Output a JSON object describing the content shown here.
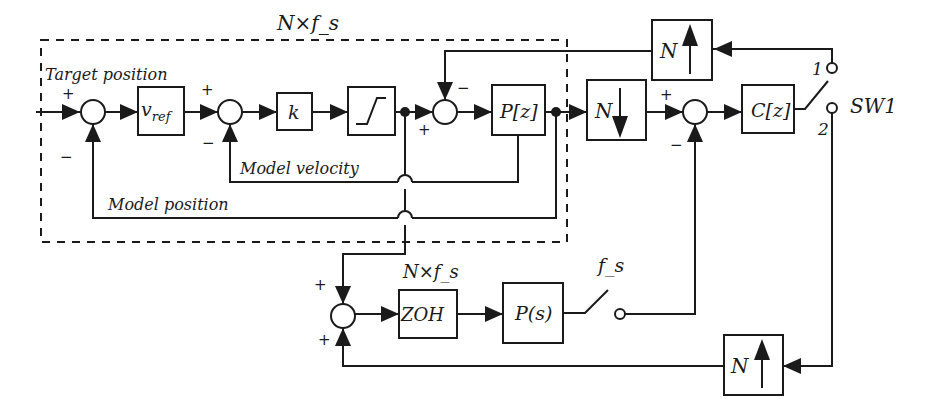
{
  "diagram": {
    "type": "block-diagram",
    "outer_region_label": "N×f_s",
    "lower_region_label": "N×f_s",
    "sampler_label": "f_s",
    "signals": {
      "target_position": "Target position",
      "model_velocity": "Model velocity",
      "model_position": "Model position"
    },
    "blocks": {
      "vref": {
        "main": "v",
        "sub": "ref"
      },
      "k": "k",
      "saturation": "saturation",
      "pz": "P[z]",
      "downsample": "N",
      "cz": "C[z]",
      "upsample_top": "N",
      "zoh": "ZOH",
      "ps": "P(s)",
      "upsample_bottom": "N"
    },
    "switch": {
      "name": "SW1",
      "pos1": "1",
      "pos2": "2"
    },
    "signs": {
      "sum1_in": "+",
      "sum1_fb": "−",
      "sum2_in": "+",
      "sum2_fb": "−",
      "sum3_in": "+",
      "sum3_fb": "−",
      "sum4_in": "+",
      "sum4_fb": "−",
      "sum5_top": "+",
      "sum5_bottom": "+"
    }
  }
}
